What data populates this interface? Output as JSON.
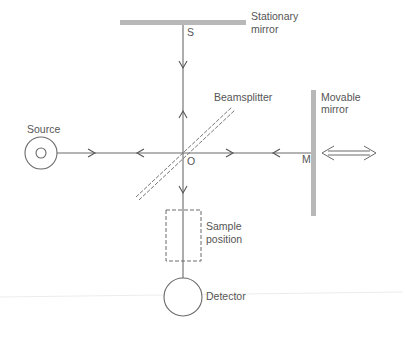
{
  "diagram": {
    "type": "Michelson interferometer schematic",
    "labels": {
      "stationary_mirror_line1": "Stationary",
      "stationary_mirror_line2": "mirror",
      "point_s": "S",
      "beamsplitter": "Beamsplitter",
      "movable_mirror_line1": "Movable",
      "movable_mirror_line2": "mirror",
      "source": "Source",
      "point_o": "O",
      "point_m": "M",
      "sample_line1": "Sample",
      "sample_line2": "position",
      "detector": "Detector"
    },
    "colors": {
      "mirror": "#b8b8b8",
      "line": "#6a6a6a",
      "text": "#555555",
      "background": "#ffffff"
    }
  }
}
